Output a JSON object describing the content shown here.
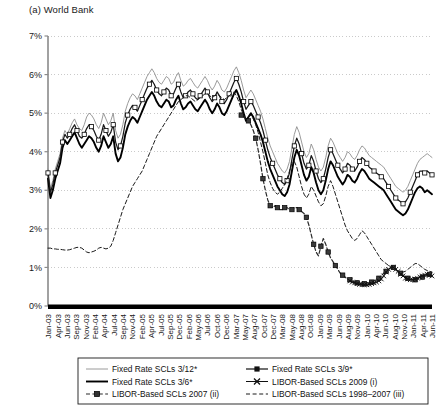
{
  "panel": {
    "title": "(a) World Bank"
  },
  "chart_data": {
    "type": "line",
    "title": "(a) World Bank",
    "xlabel": "",
    "ylabel": "",
    "ylim": [
      0,
      7
    ],
    "yticks": [
      "0%",
      "1%",
      "2%",
      "3%",
      "4%",
      "5%",
      "6%",
      "7%"
    ],
    "grid": true,
    "legend_position": "bottom",
    "x_tick_labels": [
      "Jan-03",
      "Apr-03",
      "Jun-03",
      "Sep-03",
      "Nov-03",
      "Feb-04",
      "Apr-04",
      "Jul-04",
      "Sep-04",
      "Nov-04",
      "Feb-05",
      "Apr-05",
      "Jul-05",
      "Sep-05",
      "Dec-05",
      "Feb-06",
      "May-06",
      "Jul-06",
      "Oct-06",
      "Dec-06",
      "Mar-07",
      "May-07",
      "Aug-07",
      "Oct-07",
      "Dec-07",
      "Mar-08",
      "May-08",
      "Aug-08",
      "Oct-08",
      "Jan-09",
      "Mar-09",
      "Jun-09",
      "Aug-09",
      "Nov-09",
      "Jan-10",
      "Apr-10",
      "Jun-10",
      "Aug-10",
      "Nov-10",
      "Jan-11",
      "Apr-11",
      "Jun-11"
    ],
    "x_start": "Jan-03",
    "x_end": "Jun-11",
    "series": [
      {
        "name": "Fixed Rate SCLs 3/12*",
        "style": "thin-gray",
        "marker": "none",
        "color": "#8c8c8c",
        "values": [
          3.55,
          3.05,
          3.25,
          3.55,
          3.75,
          3.95,
          4.35,
          4.55,
          4.45,
          4.6,
          4.75,
          4.85,
          4.7,
          4.6,
          4.55,
          4.7,
          4.9,
          5.0,
          4.95,
          4.85,
          4.7,
          4.6,
          4.75,
          5.0,
          4.85,
          4.7,
          4.8,
          5.0,
          4.55,
          4.35,
          4.45,
          4.7,
          5.05,
          5.25,
          5.4,
          5.5,
          5.45,
          5.35,
          5.5,
          5.65,
          5.8,
          5.95,
          6.05,
          6.15,
          6.05,
          5.9,
          5.8,
          5.75,
          5.85,
          5.95,
          5.9,
          5.75,
          5.8,
          5.95,
          6.05,
          5.85,
          5.7,
          5.75,
          5.85,
          5.9,
          5.8,
          5.7,
          5.65,
          5.75,
          5.85,
          5.95,
          5.85,
          5.7,
          5.6,
          5.7,
          5.85,
          5.75,
          5.6,
          5.55,
          5.65,
          5.8,
          5.95,
          6.1,
          6.2,
          6.05,
          5.85,
          5.6,
          5.4,
          5.5,
          5.6,
          5.5,
          5.35,
          5.2,
          5.05,
          4.85,
          4.6,
          4.35,
          4.15,
          4.0,
          3.85,
          3.7,
          3.6,
          3.5,
          3.45,
          3.55,
          3.75,
          4.1,
          4.45,
          4.65,
          4.5,
          4.25,
          4.0,
          3.85,
          3.95,
          4.2,
          4.05,
          3.8,
          3.6,
          3.5,
          3.6,
          3.85,
          4.15,
          4.35,
          4.25,
          4.1,
          3.95,
          3.85,
          3.75,
          3.85,
          4.0,
          3.95,
          3.85,
          3.8,
          3.9,
          4.05,
          4.15,
          4.1,
          4.0,
          3.9,
          3.85,
          3.8,
          3.75,
          3.7,
          3.65,
          3.6,
          3.5,
          3.4,
          3.3,
          3.2,
          3.1,
          3.05,
          3.0,
          2.95,
          3.0,
          3.1,
          3.25,
          3.4,
          3.55,
          3.7,
          3.8,
          3.85,
          3.9,
          3.95,
          3.9,
          3.85
        ]
      },
      {
        "name": "Fixed Rate SCLs 3/6*",
        "style": "thick-black",
        "marker": "none",
        "color": "#000000",
        "values": [
          3.3,
          2.8,
          3.0,
          3.3,
          3.5,
          3.7,
          4.1,
          4.3,
          4.2,
          4.3,
          4.4,
          4.5,
          4.35,
          4.2,
          4.1,
          4.2,
          4.3,
          4.4,
          4.35,
          4.25,
          4.1,
          4.0,
          4.15,
          4.4,
          4.25,
          4.1,
          4.2,
          4.4,
          3.95,
          3.75,
          3.85,
          4.1,
          4.45,
          4.65,
          4.8,
          4.9,
          4.85,
          4.75,
          4.9,
          5.05,
          5.2,
          5.35,
          5.45,
          5.55,
          5.45,
          5.3,
          5.2,
          5.15,
          5.25,
          5.35,
          5.3,
          5.15,
          5.2,
          5.35,
          5.45,
          5.25,
          5.1,
          5.15,
          5.25,
          5.3,
          5.2,
          5.1,
          5.05,
          5.15,
          5.25,
          5.35,
          5.25,
          5.1,
          5.0,
          5.1,
          5.25,
          5.15,
          5.0,
          4.95,
          5.05,
          5.2,
          5.35,
          5.5,
          5.6,
          5.45,
          5.25,
          5.0,
          4.8,
          4.9,
          5.0,
          4.9,
          4.75,
          4.6,
          4.45,
          4.25,
          4.0,
          3.75,
          3.55,
          3.4,
          3.25,
          3.1,
          3.0,
          2.9,
          2.85,
          2.95,
          3.15,
          3.5,
          3.85,
          4.05,
          3.9,
          3.65,
          3.4,
          3.25,
          3.35,
          3.6,
          3.45,
          3.2,
          3.0,
          2.9,
          3.0,
          3.25,
          3.55,
          3.75,
          3.65,
          3.5,
          3.35,
          3.25,
          3.15,
          3.25,
          3.4,
          3.35,
          3.25,
          3.2,
          3.3,
          3.45,
          3.55,
          3.5,
          3.4,
          3.3,
          3.25,
          3.2,
          3.15,
          3.1,
          3.05,
          3.0,
          2.9,
          2.8,
          2.7,
          2.6,
          2.5,
          2.45,
          2.4,
          2.35,
          2.4,
          2.5,
          2.65,
          2.8,
          2.95,
          3.05,
          3.1,
          3.05,
          2.95,
          3.0,
          2.95,
          2.9
        ]
      },
      {
        "name": "Fixed Rate SCLs 3/9*",
        "style": "medium-black",
        "marker": "filled-square",
        "color": "#1a1a1a",
        "values": [
          3.45,
          2.95,
          3.15,
          3.45,
          3.65,
          3.85,
          4.25,
          4.45,
          4.35,
          4.45,
          4.6,
          4.7,
          4.55,
          4.4,
          4.35,
          4.45,
          4.6,
          4.7,
          4.65,
          4.55,
          4.4,
          4.3,
          4.45,
          4.7,
          4.55,
          4.4,
          4.5,
          4.7,
          4.25,
          4.05,
          4.15,
          4.4,
          4.75,
          4.95,
          5.1,
          5.2,
          5.15,
          5.05,
          5.2,
          5.35,
          5.5,
          5.65,
          5.75,
          5.85,
          5.75,
          5.6,
          5.5,
          5.45,
          5.55,
          5.65,
          5.6,
          5.45,
          5.5,
          5.65,
          5.75,
          5.55,
          5.4,
          5.45,
          5.55,
          5.6,
          5.5,
          5.4,
          5.35,
          5.45,
          5.55,
          5.65,
          5.55,
          5.4,
          5.3,
          5.4,
          5.55,
          5.45,
          5.3,
          5.25,
          5.35,
          5.5,
          5.65,
          5.8,
          5.9,
          5.75,
          5.55,
          5.3,
          5.1,
          5.2,
          5.3,
          5.2,
          5.05,
          4.9,
          4.75,
          4.55,
          4.3,
          4.05,
          3.85,
          3.7,
          3.55,
          3.4,
          3.3,
          3.2,
          3.15,
          3.25,
          3.45,
          3.8,
          4.15,
          4.35,
          4.2,
          3.95,
          3.7,
          3.55,
          3.65,
          3.9,
          3.75,
          3.5,
          3.3,
          3.2,
          3.3,
          3.55,
          3.85,
          4.05,
          3.95,
          3.8,
          3.65,
          3.55,
          3.45,
          3.55,
          3.7,
          3.65,
          3.55,
          3.5,
          3.6,
          3.75,
          3.85,
          3.8,
          3.7,
          3.6,
          3.55,
          3.5,
          3.45,
          3.4,
          3.35,
          3.3,
          3.2,
          3.1,
          3.0,
          2.9,
          2.8,
          2.75,
          2.7,
          2.65,
          2.7,
          2.8,
          2.95,
          3.1,
          3.25,
          3.4,
          3.5,
          3.5,
          3.45,
          3.5,
          3.45,
          3.4
        ]
      },
      {
        "name": "LIBOR-Based SCLs 2007 (ii)",
        "style": "dashed-black",
        "marker": "filled-square-dark",
        "color": "#2b2b2b",
        "start_index": 80,
        "values": [
          4.95,
          4.9,
          4.85,
          4.8,
          4.7,
          4.55,
          4.35,
          4.05,
          3.7,
          3.3,
          3.0,
          2.75,
          2.6,
          2.55,
          2.6,
          2.55,
          2.5,
          2.5,
          2.55,
          2.55,
          2.5,
          2.5,
          2.55,
          2.55,
          2.5,
          2.45,
          2.4,
          2.3,
          2.1,
          1.85,
          1.6,
          1.4,
          1.3,
          1.55,
          1.75,
          1.6,
          1.4,
          1.25,
          1.15,
          1.05,
          0.95,
          0.85,
          0.8,
          0.75,
          0.7,
          0.68,
          0.65,
          0.62,
          0.6,
          0.6,
          0.58,
          0.58,
          0.6,
          0.6,
          0.62,
          0.65,
          0.68,
          0.72,
          0.78,
          0.85,
          0.9,
          0.95,
          1.0,
          1.0,
          0.95,
          0.9,
          0.85,
          0.8,
          0.75,
          0.72,
          0.7,
          0.68,
          0.68,
          0.7,
          0.72,
          0.75,
          0.78,
          0.8,
          0.82,
          0.8
        ]
      },
      {
        "name": "LIBOR-Based SCLs 2009 (i)",
        "style": "thin-black-x",
        "marker": "x",
        "color": "#111111",
        "start_index": 125,
        "values": [
          0.65,
          0.62,
          0.6,
          0.58,
          0.56,
          0.55,
          0.55,
          0.55,
          0.56,
          0.58,
          0.6,
          0.62,
          0.65,
          0.7,
          0.78,
          0.88,
          0.95,
          1.0,
          1.0,
          0.95,
          0.9,
          0.82,
          0.78,
          0.72,
          0.7,
          0.68,
          0.68,
          0.7,
          0.72,
          0.75,
          0.78,
          0.8,
          0.82,
          0.8,
          0.78
        ]
      },
      {
        "name": "LIBOR-Based SCLs 1998–2007 (iii)",
        "style": "dashed-thin",
        "marker": "none",
        "color": "#1a1a1a",
        "values": [
          1.5,
          1.5,
          1.48,
          1.48,
          1.47,
          1.47,
          1.46,
          1.45,
          1.45,
          1.46,
          1.48,
          1.5,
          1.52,
          1.52,
          1.5,
          1.45,
          1.4,
          1.38,
          1.4,
          1.42,
          1.45,
          1.5,
          1.52,
          1.5,
          1.48,
          1.5,
          1.55,
          1.7,
          1.9,
          2.1,
          2.3,
          2.5,
          2.65,
          2.8,
          2.95,
          3.1,
          3.2,
          3.3,
          3.4,
          3.5,
          3.65,
          3.8,
          3.95,
          4.1,
          4.25,
          4.4,
          4.5,
          4.6,
          4.7,
          4.8,
          4.9,
          5.0,
          5.1,
          5.2,
          5.3,
          5.35,
          5.4,
          5.45,
          5.45,
          5.4,
          5.35,
          5.3,
          5.35,
          5.4,
          5.45,
          5.5,
          5.5,
          5.45,
          5.4,
          5.45,
          5.5,
          5.45,
          5.4,
          5.35,
          5.4,
          5.45,
          5.5,
          5.55,
          5.45,
          5.3,
          5.1,
          4.95,
          4.85,
          4.9,
          4.95,
          4.85,
          4.7,
          4.5,
          4.25,
          4.0,
          3.7,
          3.4,
          3.2,
          3.05,
          2.95,
          2.9,
          2.95,
          3.05,
          3.15,
          3.3,
          3.5,
          3.7,
          3.75,
          3.6,
          3.35,
          3.1,
          2.9,
          2.8,
          2.9,
          3.1,
          3.0,
          2.85,
          2.7,
          2.6,
          2.65,
          2.85,
          3.1,
          3.25,
          3.1,
          2.9,
          2.7,
          2.5,
          2.3,
          2.1,
          1.95,
          1.85,
          1.75,
          1.7,
          1.75,
          1.85,
          1.95,
          1.9,
          1.8,
          1.7,
          1.6,
          1.5,
          1.4,
          1.3,
          1.2,
          1.15,
          1.1,
          1.05,
          1.0,
          0.95,
          0.92,
          0.9,
          0.88,
          0.88,
          0.9,
          0.95,
          1.0,
          1.05,
          1.1,
          1.1,
          1.05,
          1.0,
          0.95,
          0.92,
          0.9,
          0.88
        ]
      }
    ]
  },
  "legend": {
    "items": [
      {
        "label": "Fixed Rate SCLs 3/12*",
        "style": "thin-gray",
        "marker": "none"
      },
      {
        "label": "Fixed Rate SCLs 3/9*",
        "style": "medium-black",
        "marker": "filled-square"
      },
      {
        "label": "Fixed Rate SCLs 3/6*",
        "style": "thick-black",
        "marker": "none"
      },
      {
        "label": "LIBOR-Based SCLs 2009 (i)",
        "style": "thin-black-x",
        "marker": "x"
      },
      {
        "label": "LIBOR-Based SCLs 2007 (ii)",
        "style": "dashed-black",
        "marker": "filled-square-dark"
      },
      {
        "label": "LIBOR-Based SCLs 1998–2007 (iii)",
        "style": "dashed-thin",
        "marker": "none"
      }
    ]
  }
}
